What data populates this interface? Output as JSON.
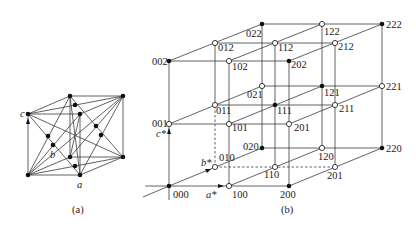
{
  "figure": {
    "panel_a": {
      "caption": "(a)",
      "axis_labels": {
        "a": "a",
        "b": "b",
        "c": "c"
      }
    },
    "panel_b": {
      "caption": "(b)",
      "axis_labels": {
        "a_star": "a*",
        "b_star": "b*",
        "c_star": "c*"
      },
      "filled_nodes": [
        "000",
        "200",
        "020",
        "220",
        "002",
        "202",
        "022",
        "222",
        "111",
        "121"
      ],
      "open_nodes": [
        "100",
        "010",
        "001",
        "110",
        "101",
        "011",
        "120",
        "201",
        "021",
        "210",
        "102",
        "012",
        "211",
        "112",
        "122",
        "212",
        "221"
      ],
      "labels": {
        "n000": "000",
        "n100": "100",
        "n200": "200",
        "n010": "010",
        "n020": "020",
        "n110": "110",
        "n120": "120",
        "n220": "220",
        "n001": "001",
        "n002": "002",
        "n101": "101",
        "n201": "201",
        "n201b": "201",
        "n011": "011",
        "n021": "021",
        "n111": "111",
        "n121": "121",
        "n211": "211",
        "n221": "221",
        "n102": "102",
        "n202": "202",
        "n012": "012",
        "n022": "022",
        "n112": "112",
        "n122": "122",
        "n212": "212",
        "n222": "222"
      }
    }
  }
}
